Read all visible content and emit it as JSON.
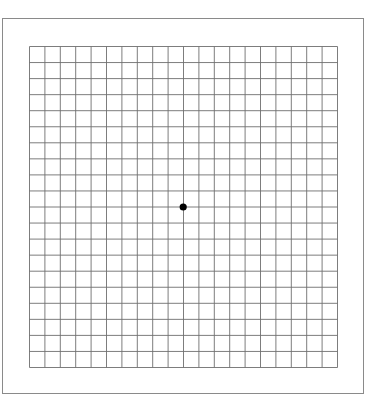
{
  "figure": {
    "type": "amsler-grid",
    "columns": 20,
    "rows": 20,
    "line_color": "#6e6e6e",
    "dot_color": "#000000",
    "frame_color": "#8a8a8a"
  }
}
